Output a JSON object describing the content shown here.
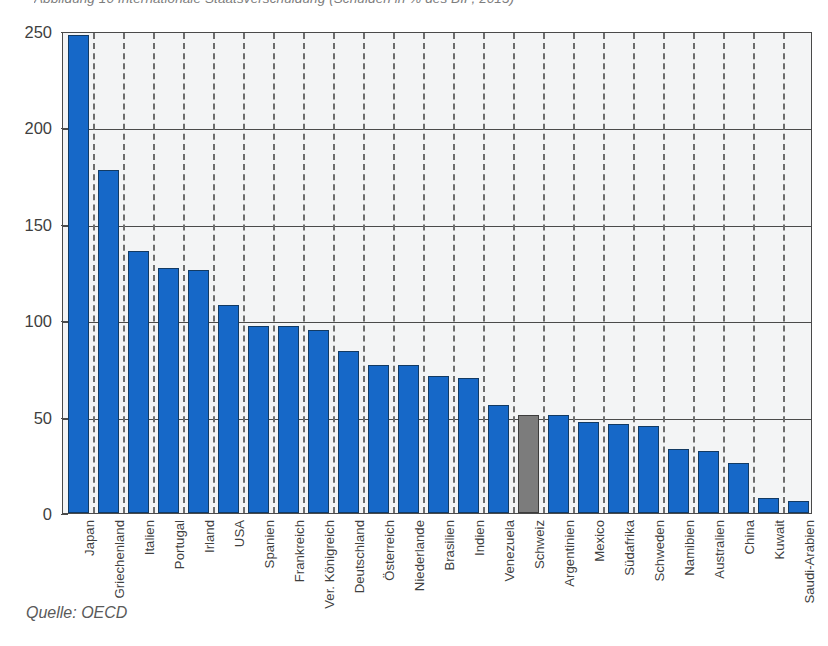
{
  "figure": {
    "title": "Abbildung 10   Internationale Staatsverschuldung (Schulden in % des BIP, 2013)",
    "source": "Quelle: OECD"
  },
  "chart_data": {
    "type": "bar",
    "title": "Abbildung 10   Internationale Staatsverschuldung (Schulden in % des BIP, 2013)",
    "xlabel": "",
    "ylabel": "",
    "ylim": [
      0,
      250
    ],
    "yticks": [
      0,
      50,
      100,
      150,
      200,
      250
    ],
    "grid": "horizontal-solid-and-vertical-dashed-separators",
    "legend": "none",
    "highlight_category": "Schweiz",
    "colors": {
      "bar": "#1668c8",
      "bar_edge": "#123a63",
      "highlight": "#7c7c7c",
      "highlight_edge": "#3c3c3c",
      "plot_background": "#f3f4f5",
      "axis": "#4a4a4a",
      "text": "#3f3f3f"
    },
    "categories": [
      "Japan",
      "Griechenland",
      "Italien",
      "Portugal",
      "Irland",
      "USA",
      "Spanien",
      "Frankreich",
      "Ver. Königreich",
      "Deutschland",
      "Österreich",
      "Niederlande",
      "Brasilien",
      "Indien",
      "Venezuela",
      "Schweiz",
      "Argentinien",
      "Mexico",
      "Südafrika",
      "Schweden",
      "Namibien",
      "Australien",
      "China",
      "Kuwait",
      "Saudi-Arabien"
    ],
    "values": [
      248,
      178,
      136,
      127,
      126,
      108,
      97,
      97,
      95,
      84,
      77,
      77,
      71,
      70,
      56,
      51,
      51,
      47,
      46,
      45,
      33,
      32,
      26,
      8,
      6
    ]
  }
}
